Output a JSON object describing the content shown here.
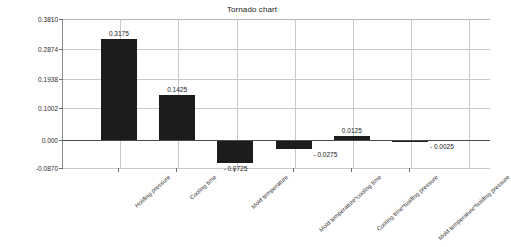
{
  "chart_data": {
    "type": "bar",
    "title": "Tornado chart",
    "xlabel": "",
    "ylabel": "",
    "orientation": "vertical",
    "grid": true,
    "legend": false,
    "ylim": [
      -0.087,
      0.381
    ],
    "ytick_labels": [
      "0.3810",
      "0.2874",
      "0.1938",
      "0.1002",
      "0.000",
      "-0.0870"
    ],
    "ytick_values": [
      0.381,
      0.2874,
      0.1938,
      0.1002,
      0.0,
      -0.087
    ],
    "categories": [
      "Holding pressure",
      "Cooling time",
      "Mold temperature",
      "Mold temperature*cooling time",
      "Cooling time*holding pressure",
      "Mold temperature*holding pressure"
    ],
    "values": [
      0.3175,
      0.1425,
      -0.0725,
      -0.0275,
      0.0125,
      -0.0025
    ],
    "value_labels": [
      "0.3175",
      "0.1425",
      "- 0.0725",
      "- 0.0275",
      "0.0125",
      "- 0.0025"
    ],
    "bar_color": "#1c1c1c",
    "zero_line_value": 0.0
  }
}
